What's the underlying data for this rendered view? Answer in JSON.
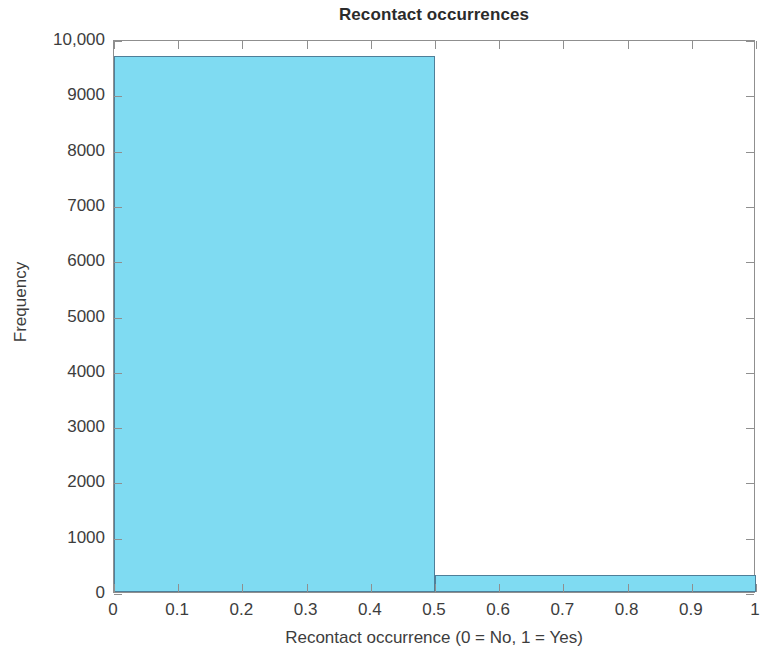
{
  "chart_data": {
    "type": "bar",
    "title": "Recontact occurrences",
    "xlabel": "Recontact occurrence (0 = No, 1 = Yes)",
    "ylabel": "Frequency",
    "xlim": [
      0,
      1
    ],
    "ylim": [
      0,
      10000
    ],
    "grid": false,
    "legend": null,
    "bar_style": {
      "fill_color": "#7FDBF2",
      "edge_color": "#4f7f99"
    },
    "bins": [
      {
        "label": "0",
        "x_start": 0,
        "x_end": 0.5,
        "value": 9700
      },
      {
        "label": "1",
        "x_start": 0.5,
        "x_end": 1,
        "value": 300
      }
    ],
    "categories": [
      "0",
      "1"
    ],
    "values": [
      9700,
      300
    ],
    "x_ticks": [
      0,
      0.1,
      0.2,
      0.3,
      0.4,
      0.5,
      0.6,
      0.7,
      0.8,
      0.9,
      1
    ],
    "x_tick_labels": [
      "0",
      "0.1",
      "0.2",
      "0.3",
      "0.4",
      "0.5",
      "0.6",
      "0.7",
      "0.8",
      "0.9",
      "1"
    ],
    "y_ticks": [
      0,
      1000,
      2000,
      3000,
      4000,
      5000,
      6000,
      7000,
      8000,
      9000,
      10000
    ],
    "y_tick_labels": [
      "0",
      "1000",
      "2000",
      "3000",
      "4000",
      "5000",
      "6000",
      "7000",
      "8000",
      "9000",
      "10,000"
    ]
  }
}
